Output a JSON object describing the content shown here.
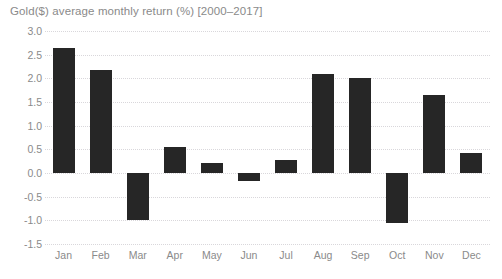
{
  "chart_data": {
    "type": "bar",
    "title": "Gold($) average monthly return (%) [2000–2017]",
    "xlabel": "",
    "ylabel": "",
    "categories": [
      "Jan",
      "Feb",
      "Mar",
      "Apr",
      "May",
      "Jun",
      "Jul",
      "Aug",
      "Sep",
      "Oct",
      "Nov",
      "Dec"
    ],
    "values": [
      2.65,
      2.18,
      -1.0,
      0.55,
      0.22,
      -0.16,
      0.27,
      2.1,
      2.0,
      -1.05,
      1.65,
      0.42
    ],
    "ylim": [
      -1.5,
      3.0
    ],
    "ytick_step": 0.5,
    "ytick_labels": [
      "3.0",
      "2.5",
      "2.0",
      "1.5",
      "1.0",
      "0.5",
      "0.0",
      "-0.5",
      "-1.0",
      "-1.5"
    ],
    "ytick_values": [
      3.0,
      2.5,
      2.0,
      1.5,
      1.0,
      0.5,
      0.0,
      -0.5,
      -1.0,
      -1.5
    ],
    "grid": true,
    "grid_style": "dotted",
    "legend": false,
    "bar_color": "#262626",
    "grid_color": "#d9d7db",
    "text_color": "#8a8a8a",
    "background_color": "#ffffff"
  }
}
